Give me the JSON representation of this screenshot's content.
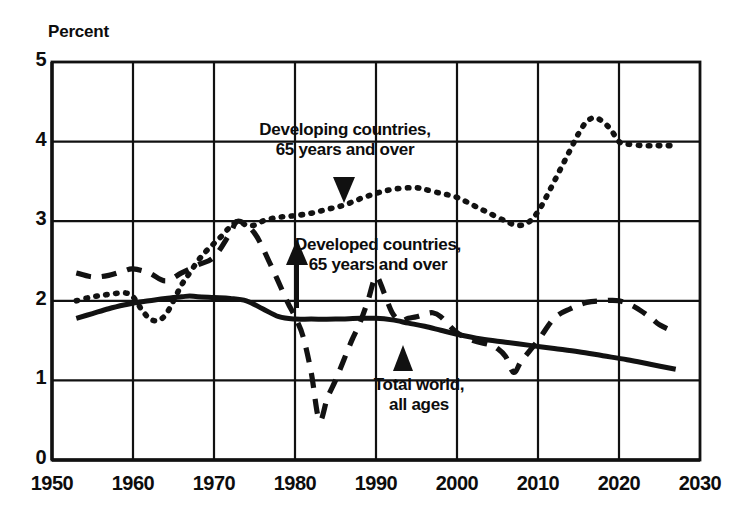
{
  "chart_data": {
    "type": "line",
    "title": "",
    "ylabel": "Percent",
    "xlabel": "",
    "ylim": [
      0,
      5
    ],
    "xlim": [
      1950,
      2030
    ],
    "grid": true,
    "legend_position": "inline-annotations",
    "yticks": [
      "0",
      "1",
      "2",
      "3",
      "4",
      "5"
    ],
    "ytick_values": [
      0,
      1,
      2,
      3,
      4,
      5
    ],
    "xticks": [
      "1950",
      "1960",
      "1970",
      "1980",
      "1990",
      "2000",
      "2010",
      "2020",
      "2030"
    ],
    "xtick_values": [
      1950,
      1960,
      1970,
      1980,
      1990,
      2000,
      2010,
      2020,
      2030
    ],
    "series": [
      {
        "name": "Developing countries, 65 years and over",
        "style": "dotted",
        "color": "#121212",
        "x": [
          1953,
          1955,
          1957,
          1959,
          1960,
          1961,
          1962,
          1963,
          1964,
          1965,
          1966,
          1967,
          1968,
          1969,
          1970,
          1971,
          1972,
          1973,
          1974,
          1975,
          1976,
          1977,
          1978,
          1979,
          1980,
          1982,
          1984,
          1986,
          1988,
          1990,
          1992,
          1994,
          1995,
          1996,
          1998,
          2000,
          2002,
          2004,
          2006,
          2007,
          2008,
          2009,
          2010,
          2011,
          2012,
          2013,
          2014,
          2015,
          2016,
          2017,
          2018,
          2019,
          2020,
          2021,
          2023,
          2025,
          2027
        ],
        "y": [
          2.0,
          2.05,
          2.08,
          2.1,
          2.05,
          1.9,
          1.78,
          1.75,
          1.82,
          2.0,
          2.2,
          2.35,
          2.5,
          2.62,
          2.72,
          2.82,
          2.93,
          3.0,
          2.95,
          2.95,
          3.0,
          3.03,
          3.05,
          3.06,
          3.07,
          3.1,
          3.15,
          3.2,
          3.28,
          3.35,
          3.4,
          3.42,
          3.42,
          3.4,
          3.35,
          3.3,
          3.2,
          3.1,
          3.0,
          2.96,
          2.95,
          3.0,
          3.12,
          3.3,
          3.5,
          3.7,
          3.9,
          4.1,
          4.25,
          4.3,
          4.25,
          4.15,
          4.0,
          3.97,
          3.95,
          3.95,
          3.95
        ]
      },
      {
        "name": "Developed countries, 65 years and over",
        "style": "dashed",
        "color": "#121212",
        "x": [
          1953,
          1955,
          1957,
          1959,
          1960,
          1962,
          1964,
          1966,
          1968,
          1970,
          1972,
          1973,
          1975,
          1977,
          1979,
          1980,
          1981,
          1982,
          1983,
          1984,
          1985,
          1986,
          1987,
          1988,
          1989,
          1990,
          1991,
          1992,
          1993,
          1994,
          1995,
          1996,
          1997,
          1998,
          2000,
          2002,
          2004,
          2005,
          2006,
          2007,
          2008,
          2010,
          2012,
          2014,
          2016,
          2018,
          2020,
          2022,
          2024,
          2025,
          2027
        ],
        "y": [
          2.35,
          2.3,
          2.32,
          2.38,
          2.4,
          2.35,
          2.25,
          2.35,
          2.45,
          2.55,
          2.85,
          3.0,
          2.85,
          2.45,
          2.0,
          1.8,
          1.55,
          1.1,
          0.5,
          0.78,
          1.0,
          1.25,
          1.5,
          1.72,
          2.0,
          2.3,
          2.1,
          1.85,
          1.75,
          1.78,
          1.8,
          1.83,
          1.85,
          1.8,
          1.6,
          1.5,
          1.45,
          1.4,
          1.3,
          1.1,
          1.25,
          1.5,
          1.78,
          1.9,
          1.98,
          2.0,
          2.0,
          1.92,
          1.78,
          1.7,
          1.6
        ]
      },
      {
        "name": "Total world, all ages",
        "style": "solid",
        "color": "#121212",
        "x": [
          1953,
          1955,
          1957,
          1959,
          1960,
          1962,
          1964,
          1966,
          1967,
          1968,
          1970,
          1972,
          1974,
          1976,
          1978,
          1980,
          1982,
          1985,
          1988,
          1990,
          1992,
          1994,
          1996,
          1998,
          2000,
          2003,
          2006,
          2009,
          2012,
          2015,
          2018,
          2021,
          2024,
          2027
        ],
        "y": [
          1.78,
          1.84,
          1.9,
          1.95,
          1.97,
          2.0,
          2.03,
          2.05,
          2.06,
          2.05,
          2.04,
          2.03,
          2.0,
          1.9,
          1.8,
          1.77,
          1.77,
          1.77,
          1.78,
          1.78,
          1.76,
          1.72,
          1.68,
          1.63,
          1.58,
          1.52,
          1.48,
          1.44,
          1.4,
          1.36,
          1.31,
          1.26,
          1.2,
          1.14
        ]
      }
    ],
    "annotations": [
      {
        "id": "developing",
        "line1": "Developing countries,",
        "line2": "65 years and over",
        "arrow": "down",
        "target_series": "Developing countries, 65 years and over"
      },
      {
        "id": "developed",
        "line1": "Developed countries,",
        "line2": "65 years and over",
        "arrow": "up",
        "target_series": "Developed countries, 65 years and over"
      },
      {
        "id": "total-world",
        "line1": "Total world,",
        "line2": "all ages",
        "arrow": "up",
        "target_series": "Total world, all ages"
      }
    ]
  }
}
